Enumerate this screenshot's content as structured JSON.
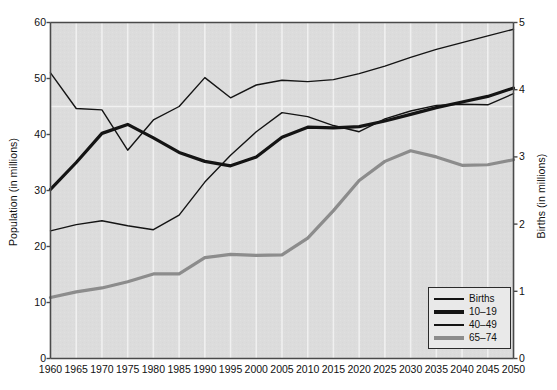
{
  "chart_data": {
    "type": "line",
    "title": "",
    "xlabel": "",
    "ylabel": "Population (in millions)",
    "y2label": "Births (in millions)",
    "ylim": [
      0,
      60
    ],
    "y2lim": [
      0,
      5
    ],
    "grid": "vertical-only",
    "legend_position": "bottom-right",
    "x": [
      1960,
      1965,
      1970,
      1975,
      1980,
      1985,
      1990,
      1995,
      2000,
      2005,
      2010,
      2015,
      2020,
      2025,
      2030,
      2035,
      2040,
      2045,
      2050
    ],
    "xticklabels": [
      "1960",
      "1965",
      "1970",
      "1975",
      "1980",
      "1985",
      "1990",
      "1995",
      "2000",
      "2005",
      "2010",
      "2015",
      "2020",
      "2025",
      "2030",
      "2035",
      "2040",
      "2045",
      "2050"
    ],
    "yticklabels": [
      "0",
      "10",
      "20",
      "30",
      "40",
      "50",
      "60"
    ],
    "yticks": [
      0,
      10,
      20,
      30,
      40,
      50,
      60
    ],
    "y2ticklabels": [
      "0",
      "1",
      "2",
      "3",
      "4",
      "5"
    ],
    "y2ticks": [
      0,
      1,
      2,
      3,
      4,
      5
    ],
    "series": [
      {
        "name": "Births",
        "axis": "right",
        "color": "#141414",
        "width": 1.4,
        "values": [
          4.25,
          3.72,
          3.7,
          3.1,
          3.55,
          3.75,
          4.18,
          3.88,
          4.07,
          4.14,
          4.12,
          4.15,
          4.24,
          4.35,
          4.48,
          4.6,
          4.7,
          4.8,
          4.9
        ],
        "values_left_scale": [
          51.0,
          44.6,
          44.4,
          37.2,
          42.6,
          45.0,
          50.2,
          46.5,
          48.8,
          49.7,
          49.4,
          49.8,
          50.9,
          52.2,
          53.8,
          55.2,
          56.4,
          57.6,
          58.8
        ]
      },
      {
        "name": "10-19",
        "axis": "left",
        "color": "#141414",
        "width": 3.2,
        "values": [
          30.2,
          35.0,
          40.2,
          41.8,
          39.4,
          36.8,
          35.2,
          34.4,
          36.0,
          39.5,
          41.3,
          41.2,
          41.4,
          42.4,
          43.6,
          44.8,
          45.8,
          46.8,
          48.3
        ]
      },
      {
        "name": "40-49",
        "axis": "left",
        "color": "#141414",
        "width": 1.4,
        "values": [
          22.8,
          23.9,
          24.6,
          23.7,
          23.0,
          25.6,
          31.5,
          36.3,
          40.5,
          43.9,
          43.2,
          41.6,
          40.5,
          42.8,
          44.2,
          45.2,
          45.4,
          45.3,
          47.3
        ]
      },
      {
        "name": "65-74",
        "axis": "left",
        "color": "#8c8c8c",
        "width": 3.2,
        "values": [
          10.9,
          11.9,
          12.6,
          13.7,
          15.1,
          15.1,
          18.0,
          18.6,
          18.4,
          18.5,
          21.5,
          26.4,
          31.8,
          35.2,
          37.1,
          36.0,
          34.5,
          34.6,
          35.5
        ]
      }
    ]
  },
  "legend": {
    "items": [
      {
        "label": "Births",
        "swatch": "sw-births",
        "icon": "line-swatch-thin-black"
      },
      {
        "label": "10–19",
        "swatch": "sw-1019",
        "icon": "line-swatch-thick-black"
      },
      {
        "label": "40–49",
        "swatch": "sw-4049",
        "icon": "line-swatch-thin-black"
      },
      {
        "label": "65–74",
        "swatch": "sw-6574",
        "icon": "line-swatch-thick-gray"
      }
    ]
  },
  "colors": {
    "plot_background": "#dcdcdc",
    "gridline": "#f2f2f2",
    "axis": "#4a4a4a",
    "series_black": "#141414",
    "series_gray": "#8c8c8c",
    "legend_background": "#e9e9e9",
    "legend_border": "#2b2b2b",
    "page_background": "#ffffff"
  }
}
